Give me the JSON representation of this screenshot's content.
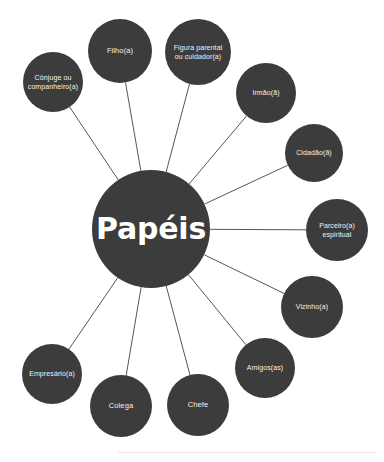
{
  "diagram": {
    "type": "radial-mind-map",
    "title": "Papéis",
    "center": {
      "label": "Papéis",
      "cx": 151,
      "cy": 229,
      "r": 59,
      "fill": "#3c3c3c",
      "text_color": "#ffffff"
    },
    "style": {
      "background": "#ffffff",
      "node_fill": "#3c3c3c",
      "node_text_color": "#f2f2f2",
      "edge_color": "#555555",
      "edge_width": 1,
      "footer_rule_color": "#e8e8e8"
    },
    "nodes": [
      {
        "id": "conjuge",
        "label": "Cônjuge ou\ncompanheiro(a)",
        "cx": 53,
        "cy": 82,
        "r": 30,
        "font_size": 7
      },
      {
        "id": "filho",
        "label": "Filho(a)",
        "cx": 120,
        "cy": 51,
        "r": 32,
        "font_size": 7.5
      },
      {
        "id": "figura-parental",
        "label": "Figura parental\nou cuidador(a)",
        "cx": 198,
        "cy": 52,
        "r": 33,
        "font_size": 7
      },
      {
        "id": "irmao",
        "label": "Irmão(ã)",
        "cx": 266,
        "cy": 93,
        "r": 30,
        "font_size": 7
      },
      {
        "id": "cidadao",
        "label": "Cidadão(ã)",
        "cx": 314,
        "cy": 153,
        "r": 29,
        "font_size": 7
      },
      {
        "id": "parceiro-espiritual",
        "label": "Parceiro(a)\nespiritual",
        "cx": 337,
        "cy": 230,
        "r": 31,
        "font_size": 7
      },
      {
        "id": "vizinho",
        "label": "Vizinho(a)",
        "cx": 312,
        "cy": 307,
        "r": 31,
        "font_size": 7
      },
      {
        "id": "amigos",
        "label": "Amigos(as)",
        "cx": 265,
        "cy": 368,
        "r": 30,
        "font_size": 7
      },
      {
        "id": "chefe",
        "label": "Chefe",
        "cx": 198,
        "cy": 405,
        "r": 31,
        "font_size": 7.5
      },
      {
        "id": "colega",
        "label": "Colega",
        "cx": 121,
        "cy": 406,
        "r": 31,
        "font_size": 7.5
      },
      {
        "id": "empresario",
        "label": "Empresário(a)",
        "cx": 52,
        "cy": 374,
        "r": 30,
        "font_size": 7
      }
    ],
    "edges": [
      {
        "from": "center",
        "to": "conjuge"
      },
      {
        "from": "center",
        "to": "filho"
      },
      {
        "from": "center",
        "to": "figura-parental"
      },
      {
        "from": "center",
        "to": "irmao"
      },
      {
        "from": "center",
        "to": "cidadao"
      },
      {
        "from": "center",
        "to": "parceiro-espiritual"
      },
      {
        "from": "center",
        "to": "vizinho"
      },
      {
        "from": "center",
        "to": "amigos"
      },
      {
        "from": "center",
        "to": "chefe"
      },
      {
        "from": "center",
        "to": "colega"
      },
      {
        "from": "center",
        "to": "empresario"
      }
    ]
  }
}
